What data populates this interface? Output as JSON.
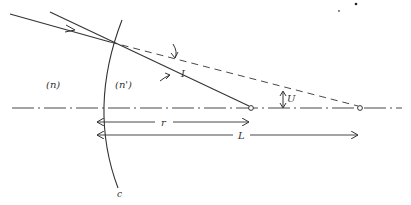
{
  "diagram": {
    "colors": {
      "line": "#333333",
      "background": "#ffffff"
    },
    "labels": {
      "medium_left": "(n)",
      "medium_right": "(n')",
      "angle_incidence": "I",
      "angle_ray": "U",
      "radius": "r",
      "distance": "L",
      "surface": "c"
    },
    "elements": [
      {
        "type": "incident-ray",
        "style": "solid",
        "arrow": true
      },
      {
        "type": "normal-line",
        "style": "solid",
        "ends_at": "center-of-curvature"
      },
      {
        "type": "extended-ray",
        "style": "dashed",
        "ends_at": "axis-intersection-point"
      },
      {
        "type": "optical-axis",
        "style": "dash-dot"
      },
      {
        "type": "refracting-surface",
        "style": "solid-curve",
        "label": "c"
      },
      {
        "type": "dimension-arrow",
        "label": "r",
        "from": "surface-vertex",
        "to": "center-of-curvature"
      },
      {
        "type": "dimension-arrow",
        "label": "L",
        "from": "surface-vertex",
        "to": "axis-intersection-point"
      }
    ]
  }
}
